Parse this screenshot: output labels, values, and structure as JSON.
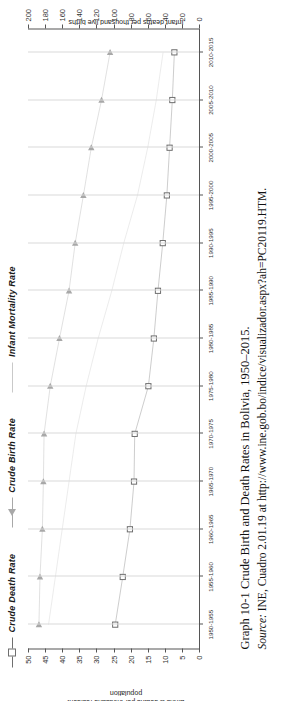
{
  "figure": {
    "caption_label": "Graph 10-1",
    "caption_text": "Crude Birth and Death Rates in Bolivia, 1950–2015.",
    "source_label": "Source:",
    "source_text": "INE, Cuadro 2.01.19 at http://www.ine.gob.bo/indice/visualizador.aspx?ah=PC20119.HTM."
  },
  "legend": {
    "items": [
      {
        "label": "Crude Death Rate",
        "marker": "square-marker",
        "color": "#6f6f6f"
      },
      {
        "label": "Crude Birth Rate",
        "marker": "triangle-marker",
        "color": "#a8a8a8"
      },
      {
        "label": "Infant Mortality Rate",
        "marker": "plain-line",
        "color": "#c9c9c9"
      }
    ]
  },
  "chart_data": {
    "type": "line",
    "title": "",
    "xlabel": "",
    "ylabel": "Births & deaths per thousand resident population",
    "y2label": "Infant deaths per thousand live births",
    "grid": true,
    "legend_position": "top",
    "ylim": [
      0,
      50
    ],
    "y2lim": [
      0,
      200
    ],
    "yticks": [
      0,
      5,
      10,
      15,
      20,
      25,
      30,
      35,
      40,
      45,
      50
    ],
    "y2ticks": [
      0,
      20,
      40,
      60,
      80,
      100,
      120,
      140,
      160,
      180,
      200
    ],
    "categories": [
      "1950-1955",
      "1955-1960",
      "1960-1965",
      "1965-1970",
      "1970-1975",
      "1975-1980",
      "1980-1985",
      "1985-1990",
      "1990-1995",
      "1995-2000",
      "2000-2005",
      "2005-2010",
      "2010-2015"
    ],
    "series": [
      {
        "name": "Crude Birth Rate",
        "axis": "left",
        "marker": "triangle",
        "color": "#a8a8a8",
        "values": [
          46.8,
          46.5,
          45.8,
          45.5,
          45.3,
          43.5,
          40.8,
          38.0,
          36.2,
          33.8,
          31.5,
          28.5,
          26.0
        ]
      },
      {
        "name": "Crude Death Rate",
        "axis": "left",
        "marker": "square",
        "color": "#6f6f6f",
        "values": [
          24.5,
          22.3,
          20.2,
          19.0,
          18.8,
          14.8,
          13.2,
          12.0,
          10.6,
          9.4,
          8.6,
          7.8,
          7.2
        ]
      },
      {
        "name": "Infant Mortality Rate",
        "axis": "right",
        "marker": "none",
        "color": "#c9c9c9",
        "values": [
          176,
          168,
          160,
          152,
          144,
          132,
          118,
          102,
          88,
          72,
          60,
          50,
          42
        ]
      }
    ]
  }
}
